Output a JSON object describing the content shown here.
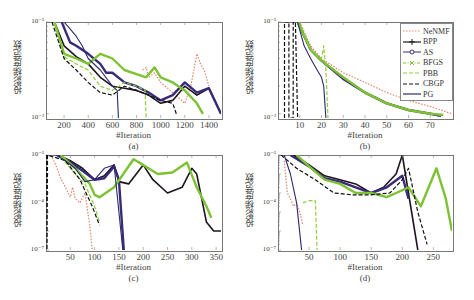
{
  "chart_data": [
    {
      "type": "line",
      "panel": "(a)",
      "caption": "(a)",
      "xlabel": "#Iteration",
      "ylabel": "投影梯度范数",
      "yscale": "log",
      "xlim": [
        50,
        1500
      ],
      "xticks": [
        200,
        400,
        600,
        800,
        1000,
        1200,
        1400
      ],
      "yticks": [
        "10⁻¹",
        "10⁻²"
      ],
      "series": [
        {
          "name": "NeNMF",
          "x": [
            850,
            880,
            900,
            950,
            1000,
            1100,
            1200,
            1250,
            1300,
            1330,
            1360,
            1400
          ],
          "y": [
            0.3,
            0.32,
            0.25,
            0.28,
            0.22,
            0.17,
            0.13,
            0.2,
            0.45,
            0.35,
            0.3,
            0.2
          ]
        },
        {
          "name": "BPP",
          "x": [
            120,
            200,
            300,
            400,
            500,
            600,
            700,
            800,
            900,
            1000,
            1100,
            1200,
            1300,
            1400,
            1500
          ],
          "y": [
            1.0,
            0.55,
            0.42,
            0.35,
            0.25,
            0.2,
            0.19,
            0.18,
            0.16,
            0.13,
            0.14,
            0.2,
            0.16,
            0.19,
            0.1
          ]
        },
        {
          "name": "AS",
          "x": [
            180,
            250,
            300,
            400,
            500,
            550,
            600,
            700,
            800,
            900,
            1000,
            1100,
            1200,
            1300,
            1400,
            1500
          ],
          "y": [
            1.0,
            0.6,
            0.55,
            0.45,
            0.35,
            0.28,
            0.28,
            0.22,
            0.2,
            0.17,
            0.14,
            0.16,
            0.22,
            0.17,
            0.19,
            0.1
          ]
        },
        {
          "name": "BFGS",
          "x": [
            120,
            200,
            300,
            400,
            500,
            600,
            700,
            800,
            880,
            950,
            1000,
            1100,
            1200,
            1300,
            1350
          ],
          "y": [
            1.0,
            0.45,
            0.4,
            0.35,
            0.45,
            0.4,
            0.3,
            0.27,
            0.25,
            0.32,
            0.25,
            0.22,
            0.18,
            0.13,
            0.1
          ]
        },
        {
          "name": "PBB",
          "x": [
            120,
            200,
            300,
            400,
            500,
            600,
            700,
            800,
            870,
            880
          ],
          "y": [
            1.0,
            0.42,
            0.35,
            0.3,
            0.2,
            0.18,
            0.22,
            0.2,
            0.18,
            0.09
          ]
        },
        {
          "name": "CBGP",
          "x": [
            100,
            200,
            300,
            400,
            500,
            600,
            700,
            800,
            900,
            1000,
            1100,
            1130
          ],
          "y": [
            1.0,
            0.4,
            0.3,
            0.22,
            0.17,
            0.16,
            0.2,
            0.18,
            0.16,
            0.14,
            0.13,
            0.1
          ]
        },
        {
          "name": "PG",
          "x": [
            200,
            300,
            350,
            400,
            500,
            600,
            640,
            650
          ],
          "y": [
            1.0,
            0.7,
            0.55,
            0.4,
            0.3,
            0.2,
            0.18,
            0.09
          ]
        }
      ]
    },
    {
      "type": "line",
      "panel": "(b)",
      "caption": "(b)",
      "xlabel": "#Iteration",
      "ylabel": "投影梯度范数",
      "yscale": "log",
      "xlim": [
        0,
        80
      ],
      "xticks": [
        10,
        20,
        30,
        40,
        50,
        60,
        70
      ],
      "yticks": [
        "10⁻¹",
        "10⁻²"
      ],
      "legend": {
        "position": "upper right",
        "entries": [
          "NeNMF",
          "BPP",
          "AS",
          "BFGS",
          "PBB",
          "CBGP",
          "PG"
        ]
      },
      "series": [
        {
          "name": "NeNMF",
          "x": [
            10,
            15,
            20,
            30,
            40,
            50,
            60,
            70,
            80
          ],
          "y": [
            1.0,
            0.55,
            0.4,
            0.28,
            0.22,
            0.17,
            0.14,
            0.12,
            0.1
          ]
        },
        {
          "name": "BPP",
          "x": [
            9,
            15,
            20,
            30,
            40,
            50,
            60,
            70,
            74
          ],
          "y": [
            1.0,
            0.5,
            0.38,
            0.24,
            0.17,
            0.13,
            0.11,
            0.1,
            0.095
          ]
        },
        {
          "name": "AS",
          "x": [
            9,
            15,
            20,
            30,
            40,
            50,
            60,
            70,
            75
          ],
          "y": [
            1.0,
            0.5,
            0.38,
            0.24,
            0.17,
            0.13,
            0.11,
            0.1,
            0.095
          ]
        },
        {
          "name": "BFGS",
          "x": [
            9,
            15,
            20,
            30,
            40,
            50,
            60,
            70,
            76
          ],
          "y": [
            1.0,
            0.5,
            0.38,
            0.25,
            0.17,
            0.13,
            0.11,
            0.1,
            0.097
          ]
        },
        {
          "name": "PBB",
          "x": [
            10,
            15,
            20,
            21,
            22,
            23
          ],
          "y": [
            1.0,
            0.5,
            0.4,
            0.55,
            0.3,
            0.09
          ]
        },
        {
          "name": "CBGP",
          "x": [
            3,
            3,
            5,
            5,
            7,
            7,
            8,
            9
          ],
          "y": [
            0.09,
            1.0,
            1.0,
            0.09,
            0.09,
            1.0,
            1.0,
            0.09
          ]
        },
        {
          "name": "PG",
          "x": [
            9,
            12,
            15,
            18,
            20,
            21,
            22
          ],
          "y": [
            1.0,
            0.55,
            0.4,
            0.3,
            0.25,
            0.2,
            0.09
          ]
        }
      ]
    },
    {
      "type": "line",
      "panel": "(c)",
      "caption": "(c)",
      "xlabel": "#Iteration",
      "ylabel": "投影梯度范数",
      "yscale": "log",
      "xlim": [
        0,
        360
      ],
      "xticks": [
        50,
        100,
        150,
        200,
        250,
        300,
        350
      ],
      "yticks": [
        "10⁻¹",
        "10⁻⁴",
        "10⁻⁷"
      ],
      "series": [
        {
          "name": "NeNMF",
          "x": [
            10,
            20,
            30,
            40,
            50,
            55,
            60,
            70,
            80,
            90,
            95
          ],
          "y": [
            1.0,
            0.3,
            0.06,
            0.02,
            0.006,
            0.02,
            0.005,
            0.003,
            0.01,
            0.0002,
            1e-05
          ]
        },
        {
          "name": "BPP",
          "x": [
            25,
            50,
            75,
            100,
            120,
            140,
            150,
            170,
            200,
            220,
            250,
            280,
            300,
            310,
            330,
            345,
            360
          ],
          "y": [
            1.0,
            0.5,
            0.2,
            0.05,
            0.08,
            0.3,
            0.04,
            0.03,
            0.3,
            0.05,
            0.01,
            0.02,
            0.2,
            0.1,
            0.0003,
            0.0001,
            0.0001
          ]
        },
        {
          "name": "AS",
          "x": [
            25,
            50,
            75,
            100,
            120,
            140,
            150,
            160
          ],
          "y": [
            1.0,
            0.4,
            0.15,
            0.05,
            0.06,
            0.25,
            0.05,
            1e-05
          ]
        },
        {
          "name": "BFGS",
          "x": [
            30,
            60,
            90,
            100,
            110,
            140,
            180,
            200,
            230,
            260,
            290,
            310,
            330,
            340
          ],
          "y": [
            1.0,
            0.2,
            0.03,
            0.008,
            0.006,
            0.02,
            0.6,
            0.3,
            0.1,
            0.12,
            0.4,
            0.02,
            0.002,
            0.0005
          ]
        },
        {
          "name": "PBB",
          "x": [
            30,
            60,
            80,
            100,
            110
          ],
          "y": [
            0.8,
            0.1,
            0.03,
            0.002,
            0.0003
          ]
        },
        {
          "name": "CBGP",
          "x": [
            1,
            2,
            3,
            40,
            70,
            95,
            110
          ],
          "y": [
            1.0,
            1e-05,
            1.0,
            0.5,
            0.05,
            0.002,
            0.0002
          ]
        },
        {
          "name": "PG",
          "x": [
            20,
            40,
            60,
            80,
            100,
            120,
            140,
            158
          ],
          "y": [
            1.0,
            0.5,
            0.2,
            0.04,
            0.05,
            0.2,
            0.3,
            1e-05
          ]
        }
      ]
    },
    {
      "type": "line",
      "panel": "(d)",
      "caption": "(d)",
      "xlabel": "#Iteration",
      "ylabel": "投影梯度范数",
      "yscale": "log",
      "xlim": [
        0,
        280
      ],
      "xticks": [
        50,
        100,
        150,
        200,
        250
      ],
      "yticks": [
        "10⁻¹",
        "10⁻⁴",
        "10⁻⁷"
      ],
      "series": [
        {
          "name": "NeNMF",
          "x": [
            10,
            15,
            20,
            25,
            30,
            35,
            40
          ],
          "y": [
            0.5,
            0.01,
            0.005,
            0.002,
            0.003,
            0.001,
            0.0002
          ]
        },
        {
          "name": "BPP",
          "x": [
            25,
            50,
            75,
            100,
            125,
            150,
            170,
            190,
            200,
            210,
            225
          ],
          "y": [
            1.0,
            0.3,
            0.08,
            0.05,
            0.03,
            0.01,
            0.02,
            0.1,
            1.0,
            0.01,
            1e-05
          ]
        },
        {
          "name": "AS",
          "x": [
            20,
            50,
            75,
            100,
            125,
            150,
            175,
            200,
            210
          ],
          "y": [
            1.0,
            0.25,
            0.06,
            0.04,
            0.02,
            0.01,
            0.02,
            0.08,
            0.005
          ]
        },
        {
          "name": "BFGS",
          "x": [
            30,
            50,
            75,
            100,
            125,
            150,
            175,
            190,
            210,
            230,
            255,
            270,
            280
          ],
          "y": [
            1.0,
            0.25,
            0.05,
            0.03,
            0.01,
            0.01,
            0.006,
            0.01,
            0.02,
            0.002,
            0.2,
            0.005,
            0.0001
          ]
        },
        {
          "name": "PBB",
          "x": [
            40,
            50,
            60,
            63
          ],
          "y": [
            0.003,
            0.004,
            0.004,
            1e-05
          ]
        },
        {
          "name": "CBGP",
          "x": [
            5,
            30,
            60,
            90,
            120,
            150,
            180,
            200,
            210,
            225,
            240
          ],
          "y": [
            1.0,
            0.2,
            0.05,
            0.01,
            0.008,
            0.008,
            0.01,
            0.05,
            0.2,
            0.001,
            2e-05
          ]
        },
        {
          "name": "PG",
          "x": [
            10,
            20,
            30,
            38
          ],
          "y": [
            1.0,
            0.1,
            0.003,
            1e-05
          ]
        }
      ]
    }
  ],
  "series_styles": {
    "NeNMF": {
      "color": "#e8826a",
      "dash": "1.5,1.5",
      "width": 1.2
    },
    "BPP": {
      "color": "#1e1420",
      "dash": "",
      "width": 1.6
    },
    "AS": {
      "color": "#3a2a7a",
      "dash": "",
      "width": 2.4
    },
    "BFGS": {
      "color": "#7cc232",
      "dash": "",
      "width": 2.4
    },
    "PBB": {
      "color": "#8fcf3a",
      "dash": "4,2",
      "width": 1.2
    },
    "CBGP": {
      "color": "#111111",
      "dash": "4,2",
      "width": 1.2
    },
    "PG": {
      "color": "#2a2a6a",
      "dash": "",
      "width": 1.1
    }
  },
  "legend": {
    "entries": [
      "NeNMF",
      "BPP",
      "AS",
      "BFGS",
      "PBB",
      "CBGP",
      "PG"
    ]
  },
  "captions": {
    "a": "(a)",
    "b": "(b)",
    "c": "(c)",
    "d": "(d)"
  },
  "xlabel": "#Iteration",
  "ylabel": "投影梯度范数"
}
